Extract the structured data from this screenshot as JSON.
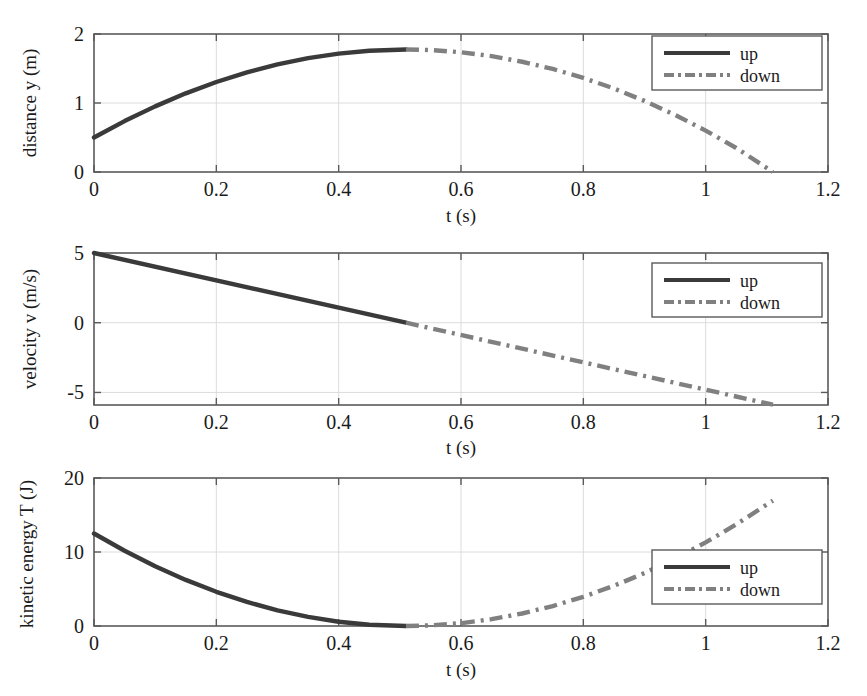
{
  "figure": {
    "background": "#ffffff",
    "colors": {
      "up": "#3a3a3a",
      "down": "#808080",
      "axis": "#5a5a5a",
      "grid": "#d8d8d8",
      "text": "#1a1a1a"
    }
  },
  "legend": {
    "up_label": "up",
    "down_label": "down"
  },
  "shared": {
    "xlabel": "t (s)",
    "xticks": [
      "0",
      "0.2",
      "0.4",
      "0.6",
      "0.8",
      "1",
      "1.2"
    ],
    "xtick_values": [
      0,
      0.2,
      0.4,
      0.6,
      0.8,
      1,
      1.2
    ],
    "xlim": [
      0,
      1.2
    ],
    "series_names": [
      "up",
      "down"
    ]
  },
  "chart_data": [
    {
      "type": "line",
      "id": "distance",
      "title": "",
      "xlabel": "t (s)",
      "ylabel": "distance y (m)",
      "xlim": [
        0,
        1.2
      ],
      "ylim": [
        0,
        2
      ],
      "xticks": [
        0,
        0.2,
        0.4,
        0.6,
        0.8,
        1,
        1.2
      ],
      "xticklabels": [
        "0",
        "0.2",
        "0.4",
        "0.6",
        "0.8",
        "1",
        "1.2"
      ],
      "yticks": [
        0,
        1,
        2
      ],
      "yticklabels": [
        "0",
        "1",
        "2"
      ],
      "grid": true,
      "legend_position": "top-right",
      "series": [
        {
          "name": "up",
          "style": "solid",
          "color": "#3a3a3a",
          "x": [
            0,
            0.05,
            0.1,
            0.15,
            0.2,
            0.25,
            0.3,
            0.35,
            0.4,
            0.45,
            0.51
          ],
          "values": [
            0.5,
            0.738,
            0.951,
            1.14,
            1.304,
            1.444,
            1.559,
            1.65,
            1.716,
            1.758,
            1.776
          ]
        },
        {
          "name": "down",
          "style": "dashdot",
          "color": "#808080",
          "x": [
            0.51,
            0.55,
            0.6,
            0.65,
            0.7,
            0.75,
            0.8,
            0.85,
            0.9,
            0.95,
            1.0,
            1.05,
            1.11
          ],
          "values": [
            1.776,
            1.768,
            1.736,
            1.679,
            1.598,
            1.493,
            1.364,
            1.21,
            1.031,
            0.828,
            0.6,
            0.348,
            0.0
          ]
        }
      ]
    },
    {
      "type": "line",
      "id": "velocity",
      "title": "",
      "xlabel": "t (s)",
      "ylabel": "velocity v (m/s)",
      "xlim": [
        0,
        1.2
      ],
      "ylim": [
        -5.9,
        5
      ],
      "xticks": [
        0,
        0.2,
        0.4,
        0.6,
        0.8,
        1,
        1.2
      ],
      "xticklabels": [
        "0",
        "0.2",
        "0.4",
        "0.6",
        "0.8",
        "1",
        "1.2"
      ],
      "yticks": [
        -5,
        0,
        5
      ],
      "yticklabels": [
        "-5",
        "0",
        "5"
      ],
      "grid": true,
      "legend_position": "top-right",
      "series": [
        {
          "name": "up",
          "style": "solid",
          "color": "#3a3a3a",
          "x": [
            0,
            0.51
          ],
          "values": [
            5.0,
            0.0
          ]
        },
        {
          "name": "down",
          "style": "dashdot",
          "color": "#808080",
          "x": [
            0.51,
            1.11
          ],
          "values": [
            0.0,
            -5.88
          ]
        }
      ]
    },
    {
      "type": "line",
      "id": "kinetic-energy",
      "title": "",
      "xlabel": "t (s)",
      "ylabel": "kinetic energy T (J)",
      "xlim": [
        0,
        1.2
      ],
      "ylim": [
        0,
        20
      ],
      "xticks": [
        0,
        0.2,
        0.4,
        0.6,
        0.8,
        1,
        1.2
      ],
      "xticklabels": [
        "0",
        "0.2",
        "0.4",
        "0.6",
        "0.8",
        "1",
        "1.2"
      ],
      "yticks": [
        0,
        10,
        20
      ],
      "yticklabels": [
        "0",
        "10",
        "20"
      ],
      "grid": true,
      "legend_position": "right-lower",
      "series": [
        {
          "name": "up",
          "style": "solid",
          "color": "#3a3a3a",
          "x": [
            0,
            0.05,
            0.1,
            0.15,
            0.2,
            0.25,
            0.3,
            0.35,
            0.4,
            0.45,
            0.51
          ],
          "values": [
            12.5,
            10.17,
            8.08,
            6.23,
            4.62,
            3.25,
            2.12,
            1.23,
            0.58,
            0.17,
            0.0
          ]
        },
        {
          "name": "down",
          "style": "dashdot",
          "color": "#808080",
          "x": [
            0.51,
            0.55,
            0.6,
            0.65,
            0.7,
            0.75,
            0.8,
            0.85,
            0.9,
            0.95,
            1.0,
            1.05,
            1.11
          ],
          "values": [
            0.0,
            0.08,
            0.38,
            0.92,
            1.69,
            2.7,
            3.95,
            5.43,
            7.15,
            9.11,
            11.3,
            13.73,
            16.95
          ]
        }
      ]
    }
  ]
}
